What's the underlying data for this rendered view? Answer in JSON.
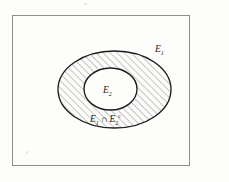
{
  "figure": {
    "caption": "",
    "background_color": "#fdfdfc",
    "frame": {
      "name": "universal-set-frame",
      "x": 12,
      "y": 15,
      "width": 178,
      "height": 151,
      "stroke_color": "#8e8e8e",
      "stroke_width": 1
    },
    "regions": {
      "outer_set": {
        "label": "E",
        "subscript": "1",
        "superscript": "",
        "cx": 114.5,
        "cy": 89.5,
        "rx": 56.5,
        "ry": 38.5,
        "stroke_color": "#1c1c1c",
        "shaded": true
      },
      "inner_set": {
        "label": "E",
        "subscript": "2",
        "superscript": "",
        "cx": 110.5,
        "cy": 89,
        "rx": 26.5,
        "ry": 21,
        "stroke_color": "#1c1c1c",
        "shaded": false
      },
      "shaded_region": {
        "label": "E",
        "subscript": "1",
        "operator": "∩",
        "label2": "E",
        "subscript2": "2",
        "superscript2": "c",
        "hatch_angle_deg": 45,
        "hatch_spacing_px": 5,
        "hatch_color": "#2b2b2b"
      }
    },
    "labels": {
      "outer_label": {
        "name": "label-E1",
        "x": 155,
        "y": 50
      },
      "inner_label": {
        "name": "label-E2",
        "x": 103,
        "y": 93
      },
      "shaded_label": {
        "name": "label-E1-cap-E2-complement",
        "x": 90,
        "y": 125
      }
    },
    "colors": {
      "ink": "#1c1c1c",
      "frame": "#8e8e8e",
      "paper": "#fdfdfc",
      "hatch": "#2b2b2b"
    }
  }
}
